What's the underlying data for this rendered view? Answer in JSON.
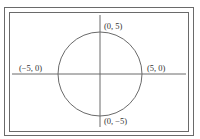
{
  "diagram": {
    "type": "circle-on-axes",
    "center": [
      0,
      0
    ],
    "radius": 5,
    "points": [
      {
        "id": "top",
        "label": "(0, 5)"
      },
      {
        "id": "left",
        "label": "(−5, 0)"
      },
      {
        "id": "right",
        "label": "(5, 0)"
      },
      {
        "id": "bottom",
        "label": "(0, −5)"
      }
    ],
    "colors": {
      "stroke": "#6a6a6a",
      "text": "#333333",
      "background": "#ffffff"
    }
  }
}
